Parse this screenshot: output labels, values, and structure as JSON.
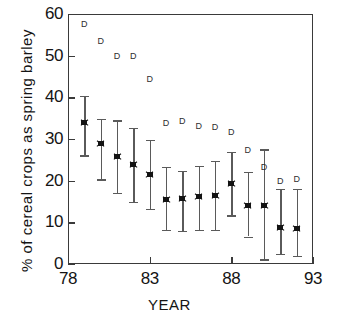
{
  "chart_data": {
    "type": "scatter",
    "title": "",
    "xlabel": "YEAR",
    "ylabel": "% of cereal crops as spring barley",
    "xlim": [
      78,
      93
    ],
    "ylim": [
      0,
      60
    ],
    "xticks": [
      78,
      83,
      88,
      93
    ],
    "yticks": [
      0,
      10,
      20,
      30,
      40,
      50,
      60
    ],
    "grid": false,
    "legend": null,
    "x": [
      79,
      80,
      81,
      82,
      83,
      84,
      85,
      86,
      87,
      88,
      89,
      90,
      91,
      92
    ],
    "series": [
      {
        "name": "mean with error bars",
        "marker": "asterisk",
        "values": [
          34.0,
          28.9,
          25.7,
          23.9,
          21.6,
          15.6,
          15.7,
          16.3,
          16.4,
          19.4,
          14.1,
          14.1,
          8.8,
          8.6
        ],
        "err_low": [
          26.1,
          20.3,
          17.0,
          14.9,
          13.3,
          8.2,
          8.0,
          8.2,
          8.2,
          11.7,
          6.6,
          1.1,
          2.4,
          1.9
        ],
        "err_high": [
          40.3,
          34.8,
          34.5,
          32.6,
          29.8,
          23.3,
          22.4,
          23.6,
          24.7,
          27.0,
          22.1,
          27.5,
          18.1,
          18.0
        ]
      },
      {
        "name": "D marker",
        "marker": "D-letter",
        "values": [
          57.5,
          53.5,
          49.9,
          50.0,
          44.3,
          33.8,
          34.3,
          33.1,
          32.8,
          31.7,
          27.4,
          23.3,
          20.0,
          20.4
        ]
      }
    ]
  },
  "axis": {
    "y_tick_labels": [
      "60",
      "50",
      "40",
      "30",
      "20",
      "10",
      "0"
    ],
    "x_tick_labels": [
      "78",
      "83",
      "88",
      "93"
    ],
    "x_title": "YEAR",
    "y_title": "% of cereal crops as spring barley"
  },
  "colors": {
    "axis": "#3a3a3a",
    "marker": "#141414",
    "error_bar": "#5a5a5a",
    "d_marker": "#2e2e2e",
    "background": "#ffffff"
  }
}
